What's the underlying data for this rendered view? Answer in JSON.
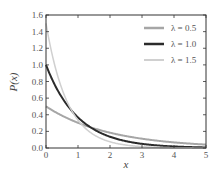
{
  "chart_data": {
    "type": "line",
    "title": "",
    "xlabel": "x",
    "ylabel": "P(x)",
    "xlim": [
      0,
      5
    ],
    "ylim": [
      0,
      1.6
    ],
    "xticks": [
      "0",
      "1",
      "2",
      "3",
      "4",
      "5"
    ],
    "yticks": [
      "0.0",
      "0.2",
      "0.4",
      "0.6",
      "0.8",
      "1.0",
      "1.2",
      "1.4",
      "1.6"
    ],
    "grid": false,
    "legend_position": "upper right",
    "function": "P(x) = λ·exp(-λx)",
    "series": [
      {
        "name": "λ = 0.5",
        "lambda": 0.5,
        "color": "#a6a6a6",
        "width": 2,
        "x": [
          0,
          1,
          2,
          3,
          4,
          5
        ],
        "values": [
          0.5,
          0.303,
          0.184,
          0.112,
          0.068,
          0.041
        ]
      },
      {
        "name": "λ = 1.0",
        "lambda": 1.0,
        "color": "#2b2b2b",
        "width": 2,
        "x": [
          0,
          1,
          2,
          3,
          4,
          5
        ],
        "values": [
          1.0,
          0.368,
          0.135,
          0.05,
          0.018,
          0.007
        ]
      },
      {
        "name": "λ = 1.5",
        "lambda": 1.5,
        "color": "#d0d0d0",
        "width": 1.5,
        "x": [
          0,
          1,
          2,
          3,
          4,
          5
        ],
        "values": [
          1.5,
          0.335,
          0.075,
          0.017,
          0.004,
          0.001
        ]
      }
    ]
  },
  "legend": {
    "items": [
      {
        "label": "λ = 0.5"
      },
      {
        "label": "λ = 1.0"
      },
      {
        "label": "λ = 1.5"
      }
    ]
  },
  "axes": {
    "xlabel": "x",
    "ylabel": "P(x)"
  }
}
